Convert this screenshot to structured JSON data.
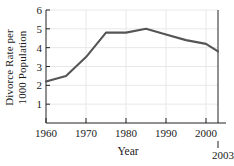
{
  "chart_data": {
    "type": "line",
    "title": "",
    "xlabel": "Year",
    "ylabel_line1": "Divorce Rate per",
    "ylabel_line2": "1000 Population",
    "x": [
      1960,
      1965,
      1970,
      1975,
      1980,
      1985,
      1990,
      1995,
      2000,
      2003
    ],
    "values": [
      2.2,
      2.5,
      3.5,
      4.8,
      4.8,
      5.0,
      4.7,
      4.4,
      4.2,
      3.8
    ],
    "series": [
      {
        "name": "Divorce Rate",
        "values": [
          2.2,
          2.5,
          3.5,
          4.8,
          4.8,
          5.0,
          4.7,
          4.4,
          4.2,
          3.8
        ]
      }
    ],
    "xlim": [
      1960,
      2003
    ],
    "ylim": [
      0,
      6
    ],
    "xticks": [
      1960,
      1970,
      1980,
      1990,
      2000
    ],
    "xticklabels": [
      "1960",
      "1970",
      "1980",
      "1990",
      "2000"
    ],
    "yticks": [
      1,
      2,
      3,
      4,
      5,
      6
    ],
    "yticklabels": [
      "1",
      "2",
      "3",
      "4",
      "5",
      "6"
    ],
    "extra_xtick": 2003,
    "extra_xticklabel": "2003",
    "grid": true,
    "legend": false,
    "line_color": "#555555",
    "grid_color": "#e8e8e8",
    "axis_color": "#222222",
    "background": "#ffffff"
  }
}
